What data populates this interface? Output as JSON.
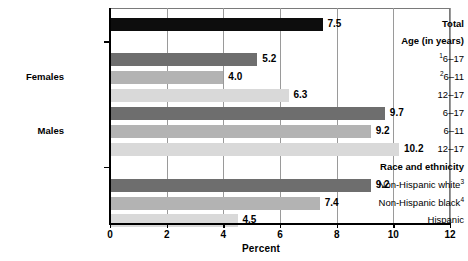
{
  "chart_data": {
    "type": "bar",
    "orientation": "horizontal",
    "title": "",
    "xlabel": "Percent",
    "ylabel": "",
    "xlim": [
      0,
      12
    ],
    "xticks": [
      0,
      2,
      4,
      6,
      8,
      10,
      12
    ],
    "xtick_labels": [
      "0",
      "2",
      "4",
      "6",
      "8",
      "10",
      "12"
    ],
    "grid": "vertical",
    "legend": "none",
    "categories": [
      "Total",
      "Age (in years)",
      "Females 6-17",
      "Females 6-11",
      "Females 12-17",
      "Males 6-17",
      "Males 6-11",
      "Males 12-17",
      "Race and ethnicity",
      "Non-Hispanic white",
      "Non-Hispanic black",
      "Hispanic"
    ],
    "values": [
      7.5,
      null,
      5.2,
      4.0,
      6.3,
      9.7,
      9.2,
      10.2,
      null,
      9.2,
      7.4,
      4.5
    ],
    "value_labels": [
      "7.5",
      "",
      "5.2",
      "4.0",
      "6.3",
      "9.7",
      "9.2",
      "10.2",
      "",
      "9.2",
      "7.4",
      "4.5"
    ]
  },
  "axis": {
    "x_title": "Percent",
    "ticks": [
      {
        "label": "0",
        "value": 0
      },
      {
        "label": "2",
        "value": 2
      },
      {
        "label": "4",
        "value": 4
      },
      {
        "label": "6",
        "value": 6
      },
      {
        "label": "8",
        "value": 8
      },
      {
        "label": "10",
        "value": 10
      },
      {
        "label": "12",
        "value": 12
      }
    ]
  },
  "colors": {
    "total": "#0d0d0d",
    "dark_gray": "#6e6e6e",
    "medium_gray": "#b3b3b3",
    "light_gray": "#d9d9d9",
    "gridline": "#9a9a9a",
    "axis": "#000000",
    "background": "#ffffff"
  },
  "rows": [
    {
      "id": "total",
      "label": "Total",
      "bold": true,
      "kind": "bar",
      "value": 7.5,
      "value_label": "7.5",
      "color_key": "total"
    },
    {
      "id": "age-header",
      "label": "Age (in years)",
      "bold": true,
      "kind": "section"
    },
    {
      "id": "females-6-17",
      "label": "6–17",
      "superscript": "1",
      "bold": false,
      "kind": "bar",
      "value": 5.2,
      "value_label": "5.2",
      "color_key": "dark_gray"
    },
    {
      "id": "females-6-11",
      "label": "6–11",
      "superscript": "2",
      "bold": false,
      "kind": "bar",
      "value": 4.0,
      "value_label": "4.0",
      "color_key": "medium_gray"
    },
    {
      "id": "females-12-17",
      "label": "12–17",
      "bold": false,
      "kind": "bar",
      "value": 6.3,
      "value_label": "6.3",
      "color_key": "light_gray"
    },
    {
      "id": "males-6-17",
      "label": "6–17",
      "bold": false,
      "kind": "bar",
      "value": 9.7,
      "value_label": "9.7",
      "color_key": "dark_gray"
    },
    {
      "id": "males-6-11",
      "label": "6–11",
      "bold": false,
      "kind": "bar",
      "value": 9.2,
      "value_label": "9.2",
      "color_key": "medium_gray"
    },
    {
      "id": "males-12-17",
      "label": "12–17",
      "bold": false,
      "kind": "bar",
      "value": 10.2,
      "value_label": "10.2",
      "color_key": "light_gray"
    },
    {
      "id": "race-header",
      "label": "Race and ethnicity",
      "bold": true,
      "kind": "section"
    },
    {
      "id": "nh-white",
      "label": "Non-Hispanic white",
      "superscript": "3",
      "bold": false,
      "kind": "bar",
      "value": 9.2,
      "value_label": "9.2",
      "color_key": "dark_gray"
    },
    {
      "id": "nh-black",
      "label": "Non-Hispanic black",
      "superscript": "4",
      "bold": false,
      "kind": "bar",
      "value": 7.4,
      "value_label": "7.4",
      "color_key": "medium_gray"
    },
    {
      "id": "hispanic",
      "label": "Hispanic",
      "bold": false,
      "kind": "bar",
      "value": 4.5,
      "value_label": "4.5",
      "color_key": "light_gray"
    }
  ],
  "group_labels": [
    {
      "id": "females",
      "label": "Females"
    },
    {
      "id": "males",
      "label": "Males"
    }
  ]
}
